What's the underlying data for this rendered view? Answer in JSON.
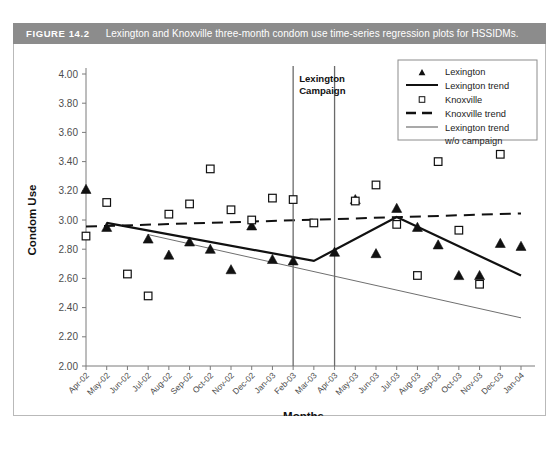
{
  "figure": {
    "number_label": "FIGURE 14.2",
    "caption": "Lexington and Knoxville three-month condom use time-series regression plots for HSSIDMs.",
    "caption_bar_color": "#8c8c8c"
  },
  "annotations": {
    "campaign_line1": "Lexington",
    "campaign_line2": "Campaign"
  },
  "legend": {
    "position": "top-right",
    "entries": [
      {
        "label": "Lexington",
        "marker": "filled-triangle",
        "color": "#111111"
      },
      {
        "label": "Lexington trend",
        "marker": "solid-line",
        "color": "#111111"
      },
      {
        "label": "Knoxville",
        "marker": "open-square",
        "color": "#111111"
      },
      {
        "label": "Knoxville trend",
        "marker": "dashed-line",
        "color": "#111111"
      },
      {
        "label": "Lexington trend",
        "label2": "w/o campaign",
        "marker": "thin-line",
        "color": "#6f6f6f"
      }
    ]
  },
  "chart_data": {
    "type": "scatter",
    "title": "Lexington and Knoxville three-month condom use time-series regression plots for HSSIDMs.",
    "xlabel": "Months",
    "ylabel": "Condom Use",
    "ylim": [
      2.0,
      4.0
    ],
    "ytick_step": 0.2,
    "ytick_labels": [
      "4.00",
      "3.80",
      "3.60",
      "3.40",
      "3.20",
      "3.00",
      "2.80",
      "2.60",
      "2.40",
      "2.20",
      "2.00"
    ],
    "grid": false,
    "categories": [
      "Apr-02",
      "May-02",
      "Jun-02",
      "Jul-02",
      "Aug-02",
      "Sep-02",
      "Oct-02",
      "Nov-02",
      "Dec-02",
      "Jan-03",
      "Feb-03",
      "Mar-03",
      "Apr-03",
      "May-03",
      "Jun-03",
      "Jul-03",
      "Aug-03",
      "Sep-03",
      "Oct-03",
      "Nov-03",
      "Dec-03",
      "Jan-04"
    ],
    "series": [
      {
        "name": "Lexington",
        "marker": "filled-triangle",
        "values": [
          3.21,
          2.95,
          null,
          2.87,
          2.76,
          2.85,
          2.8,
          2.66,
          2.96,
          2.73,
          2.72,
          null,
          2.78,
          3.14,
          2.77,
          3.08,
          2.95,
          2.83,
          2.62,
          2.62,
          2.84,
          2.82
        ]
      },
      {
        "name": "Knoxville",
        "marker": "open-square",
        "values": [
          2.89,
          3.12,
          2.63,
          2.48,
          3.04,
          3.11,
          3.35,
          3.07,
          3.0,
          3.15,
          3.14,
          2.98,
          null,
          3.13,
          3.24,
          2.97,
          2.62,
          3.4,
          2.93,
          2.56,
          3.45,
          null
        ]
      }
    ],
    "trend_lines": [
      {
        "name": "Lexington trend",
        "style": "solid-thick",
        "color": "#111111",
        "points": [
          {
            "x": "May-02",
            "y": 2.98
          },
          {
            "x": "Mar-03",
            "y": 2.72
          },
          {
            "x": "Jul-03",
            "y": 3.02
          },
          {
            "x": "Jan-04",
            "y": 2.62
          }
        ]
      },
      {
        "name": "Knoxville trend",
        "style": "dashed",
        "color": "#111111",
        "points": [
          {
            "x": "Apr-02",
            "y": 2.955
          },
          {
            "x": "Jan-04",
            "y": 3.045
          }
        ]
      },
      {
        "name": "Lexington trend w/o campaign",
        "style": "thin",
        "color": "#6f6f6f",
        "points": [
          {
            "x": "Jul-02",
            "y": 2.9
          },
          {
            "x": "Jan-04",
            "y": 2.33
          }
        ]
      }
    ],
    "vertical_markers": [
      {
        "label": "Lexington Campaign start",
        "x": "Feb-03"
      },
      {
        "label": "Lexington Campaign end",
        "x": "Apr-03"
      }
    ]
  }
}
